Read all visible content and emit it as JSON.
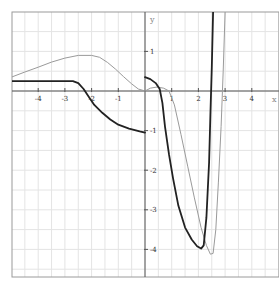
{
  "chart_data": {
    "type": "line",
    "title": "",
    "xlabel": "x",
    "ylabel": "y",
    "xlim": [
      -5,
      5
    ],
    "ylim": [
      -4.7,
      2
    ],
    "grid": true,
    "grid_step": {
      "x": 0.5,
      "y": 0.5
    },
    "legend": null,
    "x_ticks": [
      -4,
      -3,
      -2,
      -1,
      1,
      2,
      3,
      4
    ],
    "x_tick_labels": [
      "-4",
      "-3",
      "-2",
      "-1",
      "1",
      "2",
      "3",
      "4"
    ],
    "y_ticks": [
      1,
      -1,
      -2,
      -3,
      -4
    ],
    "y_tick_labels": [
      "1",
      "-1",
      "-2",
      "-3",
      "-4"
    ],
    "series": [
      {
        "name": "dark-curve",
        "color": "#222222",
        "width": 1.8,
        "segments": [
          [
            [
              -5.0,
              0.25
            ],
            [
              -3.0,
              0.25
            ],
            [
              -2.7,
              0.25
            ],
            [
              -2.5,
              0.2
            ],
            [
              -2.3,
              0.05
            ],
            [
              -2.1,
              -0.15
            ],
            [
              -1.9,
              -0.35
            ],
            [
              -1.6,
              -0.55
            ],
            [
              -1.3,
              -0.72
            ],
            [
              -1.0,
              -0.85
            ],
            [
              -0.6,
              -0.95
            ],
            [
              -0.2,
              -1.02
            ],
            [
              0.0,
              -1.05
            ]
          ],
          [
            [
              0.0,
              0.35
            ],
            [
              0.2,
              0.3
            ],
            [
              0.4,
              0.2
            ],
            [
              0.55,
              0.05
            ],
            [
              0.65,
              -0.3
            ],
            [
              0.75,
              -0.9
            ],
            [
              0.9,
              -1.6
            ],
            [
              1.05,
              -2.2
            ],
            [
              1.25,
              -2.9
            ],
            [
              1.5,
              -3.45
            ],
            [
              1.75,
              -3.75
            ],
            [
              1.95,
              -3.92
            ],
            [
              2.1,
              -3.98
            ],
            [
              2.2,
              -3.9
            ],
            [
              2.3,
              -3.2
            ],
            [
              2.4,
              -1.8
            ],
            [
              2.45,
              -0.6
            ],
            [
              2.5,
              0.6
            ],
            [
              2.55,
              2.0
            ]
          ]
        ]
      },
      {
        "name": "light-curve",
        "color": "#9a9a9a",
        "width": 1.0,
        "segments": [
          [
            [
              -5.0,
              0.35
            ],
            [
              -4.5,
              0.48
            ],
            [
              -4.0,
              0.6
            ],
            [
              -3.5,
              0.73
            ],
            [
              -3.0,
              0.83
            ],
            [
              -2.5,
              0.9
            ],
            [
              -2.0,
              0.9
            ],
            [
              -1.7,
              0.85
            ],
            [
              -1.4,
              0.72
            ],
            [
              -1.1,
              0.55
            ],
            [
              -0.8,
              0.36
            ],
            [
              -0.5,
              0.18
            ],
            [
              -0.25,
              0.05
            ],
            [
              0.0,
              0.0
            ],
            [
              0.2,
              0.07
            ],
            [
              0.45,
              0.1
            ],
            [
              0.7,
              0.07
            ],
            [
              0.9,
              0.0
            ],
            [
              1.1,
              -0.35
            ],
            [
              1.35,
              -1.1
            ],
            [
              1.6,
              -1.9
            ],
            [
              1.85,
              -2.7
            ],
            [
              2.1,
              -3.45
            ],
            [
              2.3,
              -3.9
            ],
            [
              2.45,
              -4.12
            ],
            [
              2.55,
              -4.1
            ],
            [
              2.65,
              -3.5
            ],
            [
              2.75,
              -2.3
            ],
            [
              2.85,
              -0.9
            ],
            [
              2.93,
              0.5
            ],
            [
              3.0,
              2.0
            ]
          ]
        ]
      }
    ]
  },
  "layout": {
    "frame": {
      "left": 12,
      "top": 12,
      "right": 279,
      "bottom": 277
    },
    "origin_px": {
      "x": 145,
      "y": 91
    },
    "unit_px": {
      "x": 26.7,
      "y": 39.6
    },
    "grid_color": "#e4e4e4",
    "axis_color": "#555555",
    "frame_color": "#9a9a9a"
  }
}
